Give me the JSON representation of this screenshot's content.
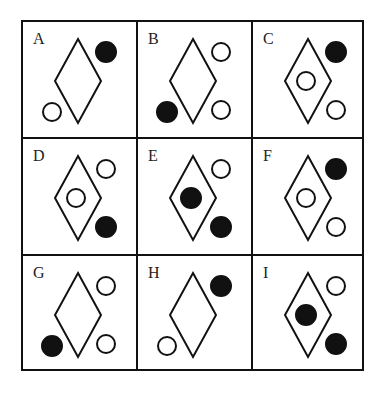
{
  "puzzle": {
    "cells": [
      {
        "label": "A",
        "inner": "none",
        "upper_right": "black",
        "lower_right": "none",
        "lower_left": "white"
      },
      {
        "label": "B",
        "inner": "none",
        "upper_right": "white",
        "lower_right": "white",
        "lower_left": "black"
      },
      {
        "label": "C",
        "inner": "white",
        "upper_right": "black",
        "lower_right": "white",
        "lower_left": "none"
      },
      {
        "label": "D",
        "inner": "white",
        "upper_right": "white",
        "lower_right": "black",
        "lower_left": "none"
      },
      {
        "label": "E",
        "inner": "black",
        "upper_right": "white",
        "lower_right": "black",
        "lower_left": "none"
      },
      {
        "label": "F",
        "inner": "white",
        "upper_right": "black",
        "lower_right": "white",
        "lower_left": "none"
      },
      {
        "label": "G",
        "inner": "none",
        "upper_right": "white",
        "lower_right": "white",
        "lower_left": "black"
      },
      {
        "label": "H",
        "inner": "none",
        "upper_right": "black",
        "lower_right": "none",
        "lower_left": "white"
      },
      {
        "label": "I",
        "inner": "black",
        "upper_right": "white",
        "lower_right": "black",
        "lower_left": "none"
      }
    ],
    "colors": {
      "line": "#111111",
      "black_fill": "#111111",
      "white_fill": "#ffffff"
    }
  }
}
